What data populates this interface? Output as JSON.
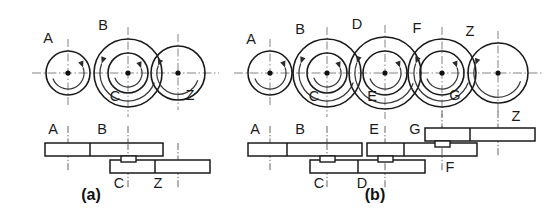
{
  "figure": {
    "background_color": "#ffffff",
    "line_color": "#1a1a1a",
    "centerline_color": "#777777",
    "width": 559,
    "height": 215,
    "axis_y": 73,
    "panels": [
      {
        "id": "a",
        "caption": "(a)",
        "caption_x": 91,
        "caption_y": 196,
        "shafts": [
          {
            "name": "shaft-1",
            "x": 68
          },
          {
            "name": "shaft-2",
            "x": 128
          },
          {
            "name": "shaft-3",
            "x": 178
          }
        ],
        "gears": [
          {
            "label": "A",
            "cx": 68,
            "cy": 73,
            "r": 22,
            "label_x": 48,
            "label_y": 39,
            "rot": "cw"
          },
          {
            "label": "B",
            "cx": 128,
            "cy": 73,
            "r": 34,
            "label_x": 103,
            "label_y": 26,
            "rot": "ccw"
          },
          {
            "label": "C",
            "cx": 128,
            "cy": 73,
            "r": 20,
            "label_x": 115,
            "label_y": 97,
            "rot": "cw"
          },
          {
            "label": "Z",
            "cx": 178,
            "cy": 73,
            "r": 27,
            "label_x": 190,
            "label_y": 96,
            "rot": "ccw"
          }
        ],
        "bars": [
          {
            "name": "bar-upper",
            "x": 45,
            "y": 143,
            "w": 118,
            "h": 13,
            "divider_x": 90,
            "labels": [
              {
                "text": "A",
                "x": 53,
                "y": 130
              },
              {
                "text": "B",
                "x": 102,
                "y": 130
              }
            ],
            "ticks": [
              68,
              128
            ]
          },
          {
            "name": "bar-lower",
            "x": 110,
            "y": 160,
            "w": 100,
            "h": 13,
            "divider_x": 155,
            "labels": [
              {
                "text": "C",
                "x": 119,
                "y": 184
              },
              {
                "text": "Z",
                "x": 158,
                "y": 184
              }
            ],
            "ticks": [
              128,
              178
            ]
          }
        ],
        "hubs": [
          {
            "name": "hub-shaft-2",
            "x": 121,
            "y": 156,
            "w": 15,
            "h": 6
          }
        ]
      },
      {
        "id": "b",
        "caption": "(b)",
        "caption_x": 375,
        "caption_y": 196,
        "shafts": [
          {
            "name": "shaft-1",
            "x": 270
          },
          {
            "name": "shaft-2",
            "x": 327
          },
          {
            "name": "shaft-3",
            "x": 385
          },
          {
            "name": "shaft-4",
            "x": 442
          },
          {
            "name": "shaft-5",
            "x": 498
          }
        ],
        "gears": [
          {
            "label": "A",
            "cx": 270,
            "cy": 73,
            "r": 22,
            "label_x": 251,
            "label_y": 40,
            "rot": "cw"
          },
          {
            "label": "B",
            "cx": 327,
            "cy": 73,
            "r": 34,
            "label_x": 300,
            "label_y": 30,
            "rot": "ccw"
          },
          {
            "label": "C",
            "cx": 327,
            "cy": 73,
            "r": 20,
            "label_x": 314,
            "label_y": 97,
            "rot": "cw"
          },
          {
            "label": "D",
            "cx": 385,
            "cy": 73,
            "r": 36,
            "label_x": 357,
            "label_y": 25,
            "rot": "ccw"
          },
          {
            "label": "E",
            "cx": 385,
            "cy": 73,
            "r": 22,
            "label_x": 372,
            "label_y": 97,
            "rot": "cw"
          },
          {
            "label": "F",
            "cx": 442,
            "cy": 73,
            "r": 34,
            "label_x": 417,
            "label_y": 29,
            "rot": "ccw"
          },
          {
            "label": "G",
            "cx": 442,
            "cy": 73,
            "r": 22,
            "label_x": 455,
            "label_y": 96,
            "rot": "cw"
          },
          {
            "label": "Z",
            "cx": 498,
            "cy": 73,
            "r": 30,
            "label_x": 470,
            "label_y": 32,
            "rot": "ccw"
          }
        ],
        "bars": [
          {
            "name": "bar-level-1",
            "x": 248,
            "y": 143,
            "w": 114,
            "h": 13,
            "divider_x": 287,
            "labels": [
              {
                "text": "A",
                "x": 255,
                "y": 130
              },
              {
                "text": "B",
                "x": 300,
                "y": 130
              }
            ],
            "ticks": [
              270,
              327
            ]
          },
          {
            "name": "bar-level-2",
            "x": 310,
            "y": 160,
            "w": 115,
            "h": 13,
            "divider_x": 358,
            "labels": [
              {
                "text": "C",
                "x": 319,
                "y": 184
              },
              {
                "text": "D",
                "x": 362,
                "y": 184
              }
            ],
            "ticks": [
              327,
              385
            ]
          },
          {
            "name": "bar-level-3",
            "x": 367,
            "y": 143,
            "w": 110,
            "h": 13,
            "divider_x": 404,
            "labels": [
              {
                "text": "E",
                "x": 374,
                "y": 130
              },
              {
                "text": "G",
                "x": 415,
                "y": 130
              }
            ],
            "ticks": [
              385,
              442
            ]
          },
          {
            "name": "bar-level-4",
            "x": 425,
            "y": 128,
            "w": 110,
            "h": 13,
            "divider_x": 470,
            "labels": [
              {
                "text": "Z",
                "x": 516,
                "y": 117
              },
              {
                "text": "F",
                "x": 450,
                "y": 168
              }
            ],
            "ticks": [
              442,
              498
            ]
          }
        ],
        "hubs": [
          {
            "name": "hub-shaft-2",
            "x": 320,
            "y": 156,
            "w": 15,
            "h": 6
          },
          {
            "name": "hub-shaft-3",
            "x": 378,
            "y": 156,
            "w": 15,
            "h": 6
          },
          {
            "name": "hub-shaft-4",
            "x": 435,
            "y": 141,
            "w": 15,
            "h": 6
          }
        ]
      }
    ]
  }
}
